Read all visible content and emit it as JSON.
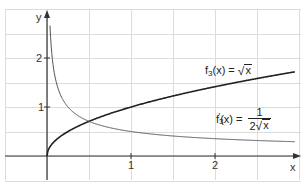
{
  "chart_data": {
    "type": "line",
    "title": "",
    "xlabel": "x",
    "ylabel": "y",
    "xlim": [
      -0.5,
      3.0
    ],
    "ylim": [
      -0.5,
      3.0
    ],
    "grid": true,
    "grid_spacing": 0.5,
    "x_ticks": [
      {
        "value": 1,
        "label": "1"
      },
      {
        "value": 2,
        "label": "2"
      }
    ],
    "y_ticks": [
      {
        "value": 1,
        "label": "1"
      },
      {
        "value": 2,
        "label": "2"
      }
    ],
    "series": [
      {
        "name": "f3(x) = √x",
        "label_parts": {
          "fname": "f",
          "sub": "3",
          "prime": "",
          "arg": "(x)",
          "eq": "=",
          "sqrt_arg": "x"
        },
        "color": "#222222",
        "stroke_width": 1.6,
        "function": "sqrt(x)",
        "x": [
          0,
          0.0625,
          0.25,
          0.5,
          1,
          1.5,
          2,
          2.5,
          2.95
        ],
        "y": [
          0,
          0.25,
          0.5,
          0.707,
          1.0,
          1.225,
          1.414,
          1.581,
          1.718
        ]
      },
      {
        "name": "f3'(x) = 1/(2√x)",
        "label_parts": {
          "fname": "f",
          "sub": "3",
          "prime": "′",
          "arg": "(x)",
          "eq": "=",
          "num": "1",
          "den_coef": "2",
          "sqrt_arg": "x"
        },
        "color": "#555555",
        "stroke_width": 1.0,
        "function": "1/(2*sqrt(x))",
        "x": [
          0.03,
          0.0625,
          0.1,
          0.25,
          0.5,
          1,
          1.5,
          2,
          2.5,
          2.95
        ],
        "y": [
          2.887,
          2.0,
          1.581,
          1.0,
          0.707,
          0.5,
          0.408,
          0.354,
          0.316,
          0.291
        ]
      }
    ],
    "intersection": {
      "x": 0.5,
      "y": 0.707
    },
    "legend_position": "inline labels"
  },
  "axes": {
    "x_name": "x",
    "y_name": "y",
    "x_tick_labels": [
      "1",
      "2"
    ],
    "y_tick_labels": [
      "1",
      "2"
    ]
  },
  "labels": {
    "f": {
      "fname": "f",
      "sub": "3",
      "arg": "(x)",
      "eq": "=",
      "sqrt_arg": "x"
    },
    "fprime": {
      "fname": "f",
      "sub": "3",
      "prime": "′",
      "arg": "(x)",
      "eq": "=",
      "num": "1",
      "den_coef": "2",
      "sqrt_arg": "x"
    }
  },
  "colors": {
    "grid": "#dcdcdc",
    "axis": "#333333",
    "curve_f": "#222222",
    "curve_fprime": "#555555"
  }
}
